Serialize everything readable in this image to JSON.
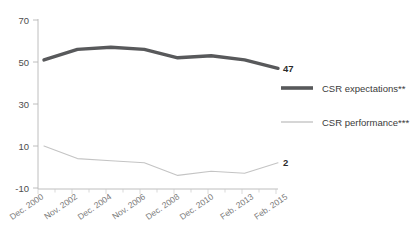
{
  "chart_data": {
    "type": "line",
    "title": "",
    "subtitle": "",
    "xlabel": "",
    "ylabel": "",
    "categories": [
      "Dec. 2000",
      "Nov. 2002",
      "Dec. 2004",
      "Nov. 2006",
      "Dec. 2008",
      "Dec. 2010",
      "Feb. 2013",
      "Feb. 2015"
    ],
    "x_tick_labels": [
      "Dec. 2000",
      "Nov. 2002",
      "Dec. 2004",
      "Nov. 2006",
      "Dec. 2008",
      "Dec. 2010",
      "Feb. 2013",
      "Feb. 2015"
    ],
    "y_tick_labels": [
      "70",
      "50",
      "30",
      "10",
      "-10"
    ],
    "y_ticks": [
      70,
      50,
      30,
      10,
      -10
    ],
    "ylim": [
      -10,
      70
    ],
    "grid": false,
    "legend_position": "right",
    "series": [
      {
        "name": "CSR expectations**",
        "color": "#58595b",
        "width": 3.4,
        "values": [
          51,
          56,
          57,
          56,
          52,
          53,
          51,
          47
        ],
        "end_label": "47"
      },
      {
        "name": "CSR performance***",
        "color": "#c4c4c4",
        "width": 1.1,
        "values": [
          10,
          4,
          3,
          2,
          -4,
          -2,
          -3,
          2
        ],
        "end_label": "2"
      }
    ],
    "annotations": [
      {
        "text": "47",
        "series": "CSR expectations**",
        "value": 47
      },
      {
        "text": "2",
        "series": "CSR performance***",
        "value": 2
      }
    ]
  },
  "legend": {
    "items": [
      {
        "label": "CSR expectations**",
        "color": "#58595b"
      },
      {
        "label": "CSR performance***",
        "color": "#c4c4c4"
      }
    ]
  },
  "colors": {
    "expectations": "#58595b",
    "performance": "#c4c4c4",
    "axis": "#b7b7b7",
    "axis_text": "#4d4d4d",
    "xlabel_text": "#7a7a7a",
    "background": "#ffffff"
  }
}
